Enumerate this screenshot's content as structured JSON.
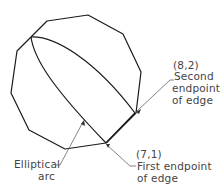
{
  "diagram": {
    "type": "geometry-annotation",
    "shape": "polygon",
    "colors": {
      "line": "#1a1a1a",
      "leader": "#555555",
      "text": "#444444",
      "background": "#ffffff"
    },
    "labels": {
      "second_point": {
        "coord": "(8,2)",
        "line1": "Second",
        "line2": "endpoint",
        "line3": "of edge"
      },
      "first_point": {
        "coord": "(7,1)",
        "line1": "First endpoint",
        "line2": "of edge"
      },
      "arc": {
        "line1": "Elliptical",
        "line2": "arc"
      }
    }
  }
}
